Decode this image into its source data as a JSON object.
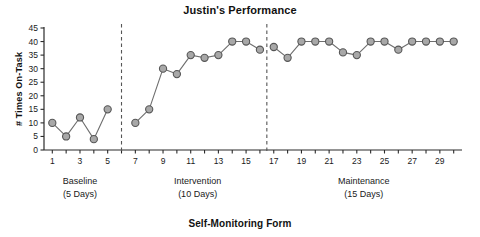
{
  "chart_data": {
    "type": "line",
    "title": "Justin's Performance",
    "caption": "Self-Monitoring Form",
    "xlabel": "",
    "ylabel": "# Times On-Task",
    "ylim": [
      0,
      45
    ],
    "xlim": [
      0.4,
      30.6
    ],
    "grid": false,
    "legend": "none",
    "ytick_labels": [
      "0",
      "5",
      "10",
      "15",
      "20",
      "25",
      "30",
      "35",
      "40",
      "45"
    ],
    "ytick_values": [
      0,
      5,
      10,
      15,
      20,
      25,
      30,
      35,
      40,
      45
    ],
    "xtick_labels": [
      "1",
      "3",
      "5",
      "7",
      "9",
      "11",
      "13",
      "15",
      "17",
      "19",
      "21",
      "23",
      "25",
      "27",
      "29"
    ],
    "xtick_values": [
      1,
      3,
      5,
      7,
      9,
      11,
      13,
      15,
      17,
      19,
      21,
      23,
      25,
      27,
      29
    ],
    "x": [
      1,
      2,
      3,
      4,
      5,
      7,
      8,
      9,
      10,
      11,
      12,
      13,
      14,
      15,
      16,
      17,
      18,
      19,
      20,
      21,
      22,
      23,
      24,
      25,
      26,
      27,
      28,
      29,
      30
    ],
    "values": [
      10,
      5,
      12,
      4,
      15,
      10,
      15,
      30,
      28,
      35,
      34,
      35,
      40,
      40,
      37,
      38,
      34,
      40,
      40,
      40,
      36,
      35,
      40,
      40,
      37,
      40,
      40,
      40,
      40
    ],
    "series": [
      {
        "name": "# Times On-Task",
        "segments": [
          {
            "phase": "Baseline",
            "x": [
              1,
              2,
              3,
              4,
              5
            ],
            "values": [
              10,
              5,
              12,
              4,
              15
            ]
          },
          {
            "phase": "Intervention",
            "x": [
              7,
              8,
              9,
              10,
              11,
              12,
              13,
              14,
              15,
              16
            ],
            "values": [
              10,
              15,
              30,
              28,
              35,
              34,
              35,
              40,
              40,
              37
            ]
          },
          {
            "phase": "Maintenance",
            "x": [
              17,
              18,
              19,
              20,
              21,
              22,
              23,
              24,
              25,
              26,
              27,
              28,
              29,
              30
            ],
            "values": [
              38,
              34,
              40,
              40,
              40,
              36,
              35,
              40,
              40,
              37,
              40,
              40,
              40,
              40
            ]
          }
        ]
      }
    ],
    "phase_dividers": [
      6,
      16.5
    ],
    "phases": [
      {
        "name": "Baseline",
        "duration": "(5 Days)",
        "center_x": 3
      },
      {
        "name": "Intervention",
        "duration": "(10 Days)",
        "center_x": 11.5
      },
      {
        "name": "Maintenance",
        "duration": "(15 Days)",
        "center_x": 23.5
      }
    ],
    "colors": {
      "marker_fill": "#a8a8a8",
      "marker_stroke": "#565656",
      "line": "#6e6e6e",
      "axis": "#2b2b2b",
      "divider": "#555555",
      "text": "#111111"
    }
  }
}
